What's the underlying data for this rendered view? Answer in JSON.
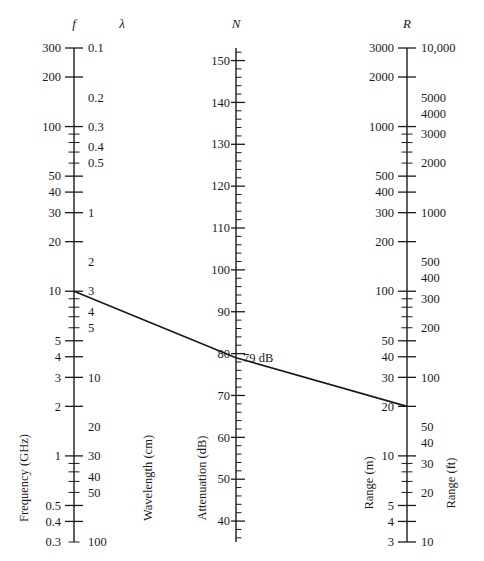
{
  "figure": {
    "type": "nomogram",
    "background": "#ffffff",
    "line_color": "#1a1a1a",
    "axis_color": "#1a1a1a"
  },
  "chart_data": {
    "type": "line",
    "title": "",
    "subtitle": "",
    "xlabel": "",
    "ylabel": "",
    "grid": false,
    "legend": "none",
    "axes": [
      {
        "id": "left",
        "symbol": "f",
        "secondary_symbol": "λ",
        "name": "Frequency (GHz)",
        "secondary_name": "Wavelength (cm)",
        "scale": "log",
        "range": [
          300,
          0.3
        ],
        "secondary_range": [
          0.1,
          100
        ],
        "direction": "decreasing-downward",
        "x_px": 74,
        "y_top_px": 48,
        "y_bottom_px": 542,
        "labels": [
          "300",
          "200",
          "100",
          "50",
          "40",
          "30",
          "20",
          "10",
          "5",
          "4",
          "3",
          "2",
          "1",
          "0.5",
          "0.4",
          "0.3"
        ],
        "values": [
          300,
          200,
          100,
          50,
          40,
          30,
          20,
          10,
          5,
          4,
          3,
          2,
          1,
          0.5,
          0.4,
          0.3
        ],
        "secondary_labels": [
          "0.1",
          "0.2",
          "0.3",
          "0.4",
          "0.5",
          "1",
          "2",
          "3",
          "4",
          "5",
          "10",
          "20",
          "30",
          "40",
          "50",
          "100"
        ],
        "secondary_values": [
          0.1,
          0.2,
          0.3,
          0.4,
          0.5,
          1,
          2,
          3,
          4,
          5,
          10,
          20,
          30,
          40,
          50,
          100
        ]
      },
      {
        "id": "middle",
        "symbol": "N",
        "name": "Attenuation (dB)",
        "scale": "linear",
        "range": [
          153,
          35
        ],
        "direction": "decreasing-downward",
        "x_px": 236,
        "y_top_px": 48,
        "y_bottom_px": 542,
        "labels": [
          "150",
          "140",
          "130",
          "120",
          "110",
          "100",
          "90",
          "80",
          "70",
          "60",
          "50",
          "40"
        ],
        "values": [
          150,
          140,
          130,
          120,
          110,
          100,
          90,
          80,
          70,
          60,
          50,
          40
        ],
        "minor_step": 2
      },
      {
        "id": "right",
        "symbol": "R",
        "name": "Range (m)",
        "secondary_name": "Range (ft)",
        "scale": "log",
        "range": [
          3000,
          3
        ],
        "secondary_range": [
          10000,
          10
        ],
        "direction": "decreasing-downward",
        "x_px": 407,
        "y_top_px": 48,
        "y_bottom_px": 542,
        "labels": [
          "3000",
          "2000",
          "1000",
          "500",
          "400",
          "300",
          "200",
          "100",
          "50",
          "40",
          "30",
          "20",
          "10",
          "5",
          "4",
          "3"
        ],
        "values": [
          3000,
          2000,
          1000,
          500,
          400,
          300,
          200,
          100,
          50,
          40,
          30,
          20,
          10,
          5,
          4,
          3
        ],
        "secondary_labels": [
          "10,000",
          "5000",
          "4000",
          "3000",
          "2000",
          "1000",
          "500",
          "400",
          "300",
          "200",
          "100",
          "50",
          "40",
          "30",
          "20",
          "10"
        ],
        "secondary_values": [
          10000,
          5000,
          4000,
          3000,
          2000,
          1000,
          500,
          400,
          300,
          200,
          100,
          50,
          40,
          30,
          20,
          10
        ]
      }
    ],
    "index_line": {
      "label": "79 dB",
      "points": [
        {
          "axis": "left",
          "f_GHz": 10,
          "lambda_cm": 3,
          "x_px": 74,
          "y_px": 290
        },
        {
          "axis": "middle",
          "N_dB": 79,
          "x_px": 236,
          "y_px": 344
        },
        {
          "axis": "right",
          "R_m": 20,
          "R_ft": 65,
          "x_px": 407,
          "y_px": 401
        }
      ]
    },
    "annotations": [
      {
        "text": "79 dB",
        "x_px": 243,
        "y_px": 345
      }
    ]
  },
  "left_axis": {
    "symbol": "f",
    "secondary_symbol": "λ",
    "name": "Frequency (GHz)",
    "secondary_name": "Wavelength (cm)"
  },
  "middle_axis": {
    "symbol": "N",
    "name": "Attenuation (dB)"
  },
  "right_axis": {
    "symbol": "R",
    "name": "Range (m)",
    "secondary_name": "Range (ft)"
  },
  "annotation": {
    "attenuation_reading": "79 dB"
  }
}
